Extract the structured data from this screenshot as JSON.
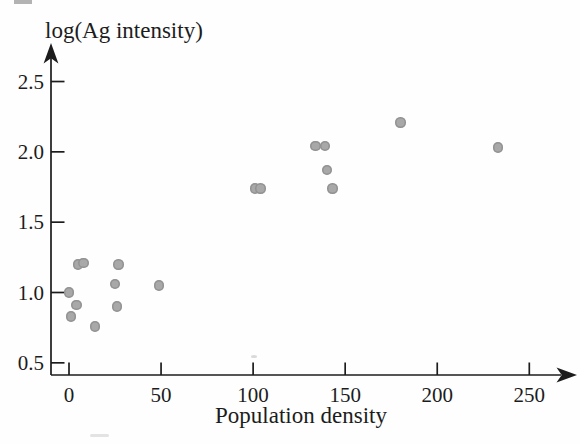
{
  "chart_data": {
    "type": "scatter",
    "title": "",
    "xlabel": "Population density",
    "ylabel": "log(Ag intensity)",
    "grid": false,
    "legend": null,
    "point_color": "#a8a8a8",
    "axis_color": "#1c1c1c",
    "xlim": [
      -10,
      276
    ],
    "ylim": [
      0.41,
      2.77
    ],
    "x_ticks": [
      {
        "value": 0,
        "label": "0"
      },
      {
        "value": 50,
        "label": "50"
      },
      {
        "value": 100,
        "label": "100"
      },
      {
        "value": 150,
        "label": "150"
      },
      {
        "value": 200,
        "label": "200"
      },
      {
        "value": 250,
        "label": "250"
      }
    ],
    "y_ticks": [
      {
        "value": 0.5,
        "label": "0.5"
      },
      {
        "value": 1.0,
        "label": "1.0"
      },
      {
        "value": 1.5,
        "label": "1.5"
      },
      {
        "value": 2.0,
        "label": "2.0"
      },
      {
        "value": 2.5,
        "label": "2.5"
      }
    ],
    "points": [
      {
        "x": 0,
        "y": 1.0
      },
      {
        "x": 1,
        "y": 0.83
      },
      {
        "x": 4,
        "y": 0.91
      },
      {
        "x": 5,
        "y": 1.2
      },
      {
        "x": 8,
        "y": 1.21
      },
      {
        "x": 14,
        "y": 0.76
      },
      {
        "x": 25,
        "y": 1.06
      },
      {
        "x": 26,
        "y": 0.9
      },
      {
        "x": 27,
        "y": 1.2
      },
      {
        "x": 49,
        "y": 1.05
      },
      {
        "x": 101,
        "y": 1.74
      },
      {
        "x": 104,
        "y": 1.74
      },
      {
        "x": 134,
        "y": 2.04
      },
      {
        "x": 139,
        "y": 2.04
      },
      {
        "x": 140,
        "y": 1.87
      },
      {
        "x": 143,
        "y": 1.74
      },
      {
        "x": 180,
        "y": 2.21
      },
      {
        "x": 233,
        "y": 2.03
      }
    ]
  }
}
